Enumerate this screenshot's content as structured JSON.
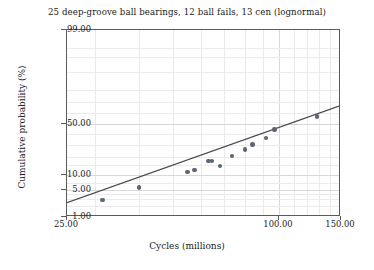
{
  "chart_data": {
    "type": "scatter",
    "title": "25 deep-groove ball bearings, 12 ball fails, 13 cen (lognormal)",
    "xlabel": "Cycles (millions)",
    "ylabel": "Cumulative probability (%)",
    "xscale": "log",
    "yscale": "lognormal-probability",
    "xlim": [
      25.0,
      150.0
    ],
    "ylim": [
      1.0,
      99.0
    ],
    "grid": true,
    "legend": null,
    "xticks": [
      {
        "value": 25.0,
        "label": "25.00"
      },
      {
        "value": 100.0,
        "label": "100.00"
      },
      {
        "value": 150.0,
        "label": "150.00"
      }
    ],
    "yticks": [
      {
        "value": 1.0,
        "label": "1.00"
      },
      {
        "value": 5.0,
        "label": "5.00"
      },
      {
        "value": 10.0,
        "label": "10.00"
      },
      {
        "value": 50.0,
        "label": "50.00"
      },
      {
        "value": 99.0,
        "label": "99.00"
      }
    ],
    "x_gridlines": [
      30,
      40,
      50,
      60,
      70,
      80,
      90,
      100,
      110,
      120,
      130,
      140
    ],
    "y_gridlines": [
      2,
      3,
      4,
      5,
      7,
      10,
      15,
      20,
      30,
      40,
      50,
      60,
      70,
      80,
      90,
      95,
      97
    ],
    "series": [
      {
        "name": "failure data",
        "type": "scatter",
        "marker": "circle",
        "color": "#5d6472",
        "points": [
          {
            "x": 31.5,
            "y": 2.9
          },
          {
            "x": 40.0,
            "y": 5.6
          },
          {
            "x": 55.0,
            "y": 11.5
          },
          {
            "x": 57.5,
            "y": 12.5
          },
          {
            "x": 63.0,
            "y": 17.5
          },
          {
            "x": 64.5,
            "y": 17.5
          },
          {
            "x": 68.0,
            "y": 14.5
          },
          {
            "x": 73.5,
            "y": 21.0
          },
          {
            "x": 80.0,
            "y": 26.0
          },
          {
            "x": 84.0,
            "y": 30.0
          },
          {
            "x": 92.0,
            "y": 36.0
          },
          {
            "x": 97.0,
            "y": 44.0
          },
          {
            "x": 128.0,
            "y": 57.0
          }
        ]
      },
      {
        "name": "lognormal fit",
        "type": "line",
        "color": "#4a4a4a",
        "endpoints": [
          {
            "x": 25.0,
            "y": 2.2
          },
          {
            "x": 150.0,
            "y": 66.0
          }
        ]
      }
    ]
  }
}
